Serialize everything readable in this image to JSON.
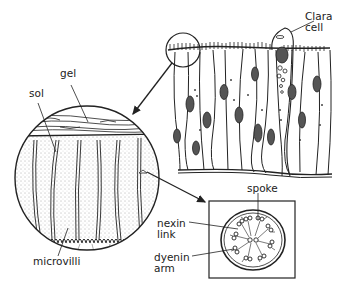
{
  "diagram": {
    "colors": {
      "ink": "#222222",
      "background": "#ffffff"
    },
    "labels": {
      "gel": "gel",
      "sol": "sol",
      "clara_cell": "Clara\ncell",
      "microvilli": "microvilli",
      "spoke": "spoke",
      "nexin_link": "nexin\nlink",
      "dyenin_arm": "dyenin\narm"
    }
  }
}
